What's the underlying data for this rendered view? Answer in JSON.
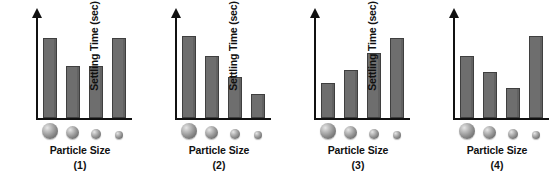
{
  "figure": {
    "background": "#ffffff",
    "bar_color": "#6e6e6e",
    "bar_outline_color": "#3f3f3f",
    "axis_color": "#111111",
    "sphere_color": "#9a9a9a"
  },
  "chart_data": [
    {
      "type": "bar",
      "title": "(1)",
      "xlabel": "Particle Size",
      "ylabel": "Settling Time (sec)",
      "categories": [
        "largest",
        "large",
        "small",
        "smallest"
      ],
      "tick_labels": [
        "",
        "",
        "",
        ""
      ],
      "values": [
        80,
        52,
        52,
        80
      ],
      "ylim": [
        0,
        100
      ],
      "grid": false,
      "legend": "none",
      "marker_sizes": [
        16,
        13,
        10,
        8
      ]
    },
    {
      "type": "bar",
      "title": "(2)",
      "xlabel": "Particle Size",
      "ylabel": "Settling Time (sec)",
      "categories": [
        "largest",
        "large",
        "small",
        "smallest"
      ],
      "tick_labels": [
        "",
        "",
        "",
        ""
      ],
      "values": [
        82,
        62,
        41,
        24
      ],
      "ylim": [
        0,
        100
      ],
      "grid": false,
      "legend": "none",
      "marker_sizes": [
        16,
        13,
        10,
        8
      ]
    },
    {
      "type": "bar",
      "title": "(3)",
      "xlabel": "Particle Size",
      "ylabel": "Settling Time (sec)",
      "categories": [
        "largest",
        "large",
        "small",
        "smallest"
      ],
      "tick_labels": [
        "",
        "",
        "",
        ""
      ],
      "values": [
        35,
        48,
        65,
        80
      ],
      "ylim": [
        0,
        100
      ],
      "grid": false,
      "legend": "none",
      "marker_sizes": [
        16,
        13,
        10,
        8
      ]
    },
    {
      "type": "bar",
      "title": "(4)",
      "xlabel": "Particle Size",
      "ylabel": "Settling Time (sec)",
      "categories": [
        "largest",
        "large",
        "small",
        "smallest"
      ],
      "tick_labels": [
        "",
        "",
        "",
        ""
      ],
      "values": [
        62,
        46,
        30,
        82
      ],
      "ylim": [
        0,
        100
      ],
      "grid": false,
      "legend": "none",
      "marker_sizes": [
        16,
        13,
        10,
        8
      ]
    }
  ],
  "panels": [
    {
      "ylabel": "Settling Time (sec)",
      "xlabel": "Particle Size",
      "number": "(1)",
      "bars": [
        {
          "height_pct": 80
        },
        {
          "height_pct": 52
        },
        {
          "height_pct": 52
        },
        {
          "height_pct": 80
        }
      ]
    },
    {
      "ylabel": "Settling Time (sec)",
      "xlabel": "Particle Size",
      "number": "(2)",
      "bars": [
        {
          "height_pct": 82
        },
        {
          "height_pct": 62
        },
        {
          "height_pct": 41
        },
        {
          "height_pct": 24
        }
      ]
    },
    {
      "ylabel": "Settling Time (sec)",
      "xlabel": "Particle Size",
      "number": "(3)",
      "bars": [
        {
          "height_pct": 35
        },
        {
          "height_pct": 48
        },
        {
          "height_pct": 65
        },
        {
          "height_pct": 80
        }
      ]
    },
    {
      "ylabel": "Settling Time (sec)",
      "xlabel": "Particle Size",
      "number": "(4)",
      "bars": [
        {
          "height_pct": 62
        },
        {
          "height_pct": 46
        },
        {
          "height_pct": 30
        },
        {
          "height_pct": 82
        }
      ]
    }
  ]
}
